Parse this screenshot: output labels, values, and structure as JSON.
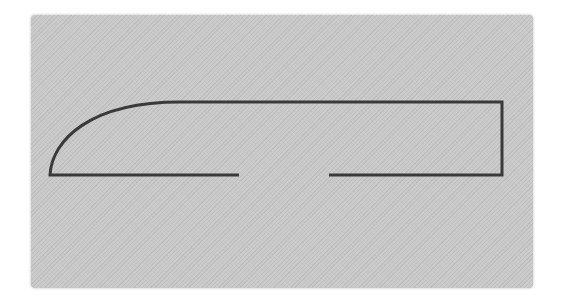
{
  "figure": {
    "colors": {
      "background": "#ffffff",
      "paper": "#c9c9c9",
      "stroke": "#3a3a3a"
    },
    "stroke_width": 3,
    "shape": {
      "left_bottom_corner": [
        50,
        175
      ],
      "curve_top_join": [
        180,
        102
      ],
      "top_right_corner": [
        502,
        102
      ],
      "bottom_right_corner": [
        502,
        175
      ],
      "bottom_gap_start_x": 239,
      "bottom_gap_end_x": 329
    }
  }
}
